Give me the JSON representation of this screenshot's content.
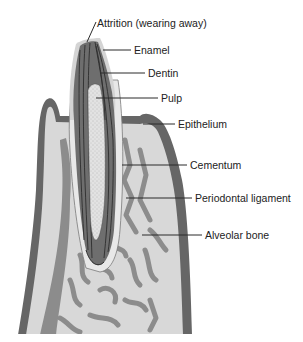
{
  "diagram": {
    "labels": [
      {
        "id": "attrition",
        "text": "Attrition (wearing away)"
      },
      {
        "id": "enamel",
        "text": "Enamel"
      },
      {
        "id": "dentin",
        "text": "Dentin"
      },
      {
        "id": "pulp",
        "text": "Pulp"
      },
      {
        "id": "epithelium",
        "text": "Epithelium"
      },
      {
        "id": "cementum",
        "text": "Cementum"
      },
      {
        "id": "periodontal",
        "text": "Periodontal ligament"
      },
      {
        "id": "alveolar",
        "text": "Alveolar bone"
      }
    ],
    "colors": {
      "enamel": "#d6d6d6",
      "dentin": "#6e6e6e",
      "dentin_lines": "#2e2e2e",
      "pulp": "#dcdcdc",
      "epithelium": "#656565",
      "bone_light": "#d9d9d9",
      "bone_dark": "#8a8a8a",
      "leader": "#2a2a2a",
      "text": "#222222"
    }
  }
}
